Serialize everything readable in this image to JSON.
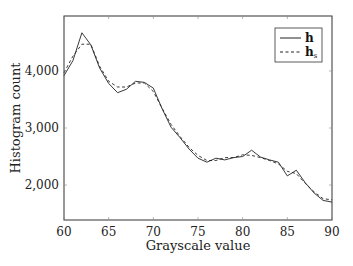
{
  "chart_data": {
    "type": "line",
    "title": "",
    "xlabel": "Grayscale value",
    "ylabel": "Histogram count",
    "xlim": [
      60,
      90
    ],
    "ylim": [
      1400,
      4950
    ],
    "xticks": [
      60,
      65,
      70,
      75,
      80,
      85,
      90
    ],
    "xtick_labels": [
      "60",
      "65",
      "70",
      "75",
      "80",
      "85",
      "90"
    ],
    "yticks": [
      2000,
      3000,
      4000
    ],
    "ytick_labels": [
      "2,000",
      "3,000",
      "4,000"
    ],
    "grid": false,
    "legend_position": "upper right",
    "series": [
      {
        "name": "h",
        "style": "solid",
        "x": [
          60,
          61,
          62,
          63,
          64,
          65,
          66,
          67,
          68,
          69,
          70,
          71,
          72,
          73,
          74,
          75,
          76,
          77,
          78,
          79,
          80,
          81,
          82,
          83,
          84,
          85,
          86,
          87,
          88,
          89,
          90
        ],
        "values": [
          3920,
          4180,
          4670,
          4460,
          4050,
          3780,
          3620,
          3680,
          3820,
          3800,
          3700,
          3330,
          3010,
          2830,
          2630,
          2470,
          2400,
          2470,
          2440,
          2480,
          2500,
          2610,
          2490,
          2440,
          2400,
          2160,
          2260,
          2040,
          1860,
          1730,
          1700
        ]
      },
      {
        "name": "h_s",
        "style": "dashed",
        "x": [
          60,
          61,
          62,
          63,
          64,
          65,
          66,
          67,
          68,
          69,
          70,
          71,
          72,
          73,
          74,
          75,
          76,
          77,
          78,
          79,
          80,
          81,
          82,
          83,
          84,
          85,
          86,
          87,
          88,
          89,
          90
        ],
        "values": [
          3970,
          4260,
          4470,
          4470,
          4080,
          3820,
          3720,
          3720,
          3790,
          3790,
          3640,
          3340,
          3060,
          2850,
          2660,
          2520,
          2430,
          2430,
          2480,
          2480,
          2530,
          2520,
          2480,
          2430,
          2370,
          2240,
          2200,
          2030,
          1880,
          1760,
          1740
        ]
      }
    ]
  },
  "legend": {
    "items": [
      {
        "label": "h",
        "subscript": "",
        "style": "solid"
      },
      {
        "label": "h",
        "subscript": "s",
        "style": "dashed"
      }
    ]
  },
  "axes": {
    "xlabel": "Grayscale value",
    "ylabel": "Histogram count"
  }
}
